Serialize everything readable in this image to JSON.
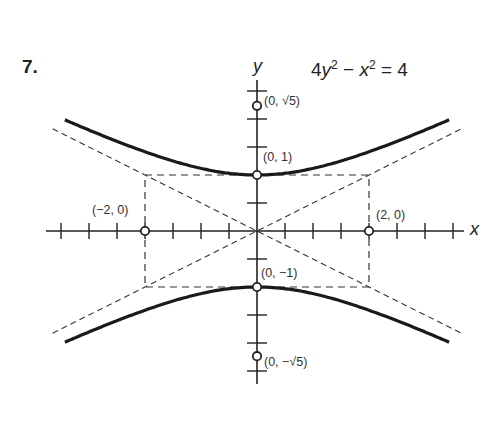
{
  "problem": {
    "number": "7.",
    "equation_lhs_a": "4",
    "equation_var_y": "y",
    "equation_exp": "2",
    "equation_minus": " − ",
    "equation_var_x": "x",
    "equation_rhs": " = 4"
  },
  "axes": {
    "x_label": "x",
    "y_label": "y"
  },
  "points": {
    "top_sqrt5": "(0, √5)",
    "vertex_top": "(0, 1)",
    "left": "(−2, 0)",
    "right": "(2, 0)",
    "vertex_bottom": "(0, −1)",
    "bottom_sqrt5": "(0, −√5)"
  },
  "chart_data": {
    "type": "line",
    "xlabel": "x",
    "ylabel": "y",
    "xlim": [
      -3.6,
      3.8
    ],
    "ylim": [
      -2.6,
      2.6
    ],
    "grid": false,
    "tick_spacing": 0.5,
    "series": [
      {
        "name": "upper branch",
        "style": "solid",
        "equation": "y = sqrt(1 + x^2/4)"
      },
      {
        "name": "lower branch",
        "style": "solid",
        "equation": "y = -sqrt(1 + x^2/4)"
      },
      {
        "name": "asymptote 1",
        "style": "dashed",
        "equation": "y = x/2"
      },
      {
        "name": "asymptote 2",
        "style": "dashed",
        "equation": "y = -x/2"
      },
      {
        "name": "fundamental rectangle",
        "style": "dashed",
        "corners": [
          [
            -2,
            1
          ],
          [
            2,
            1
          ],
          [
            2,
            -1
          ],
          [
            -2,
            -1
          ]
        ]
      }
    ],
    "annotated_points": [
      {
        "label": "(0, √5)",
        "x": 0,
        "y": 2.236
      },
      {
        "label": "(0, 1)",
        "x": 0,
        "y": 1
      },
      {
        "label": "(−2, 0)",
        "x": -2,
        "y": 0
      },
      {
        "label": "(2, 0)",
        "x": 2,
        "y": 0
      },
      {
        "label": "(0, −1)",
        "x": 0,
        "y": -1
      },
      {
        "label": "(0, −√5)",
        "x": 0,
        "y": -2.236
      }
    ]
  }
}
